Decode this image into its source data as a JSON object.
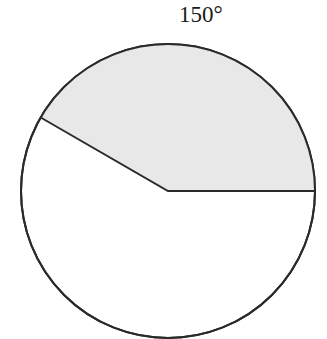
{
  "diagram": {
    "type": "circle-sector",
    "angle_label": "150°",
    "sector_angle_degrees": 150,
    "sector_start_degrees": 0,
    "sector_end_degrees": 150,
    "colors": {
      "sector_fill": "#e8e8e8",
      "circle_fill": "#ffffff",
      "stroke": "#2a2a2a"
    }
  }
}
